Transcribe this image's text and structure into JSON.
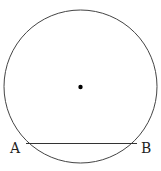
{
  "diagram": {
    "type": "circle-with-chord",
    "circle": {
      "cx": 80.5,
      "cy": 86.5,
      "r": 76.5
    },
    "center_point": {
      "x": 80.5,
      "y": 87
    },
    "chord": {
      "x1": 26,
      "y1": 143.5,
      "x2": 137,
      "y2": 143.5
    },
    "labels": {
      "a": "A",
      "b": "B"
    },
    "stroke_color": "#333333"
  }
}
